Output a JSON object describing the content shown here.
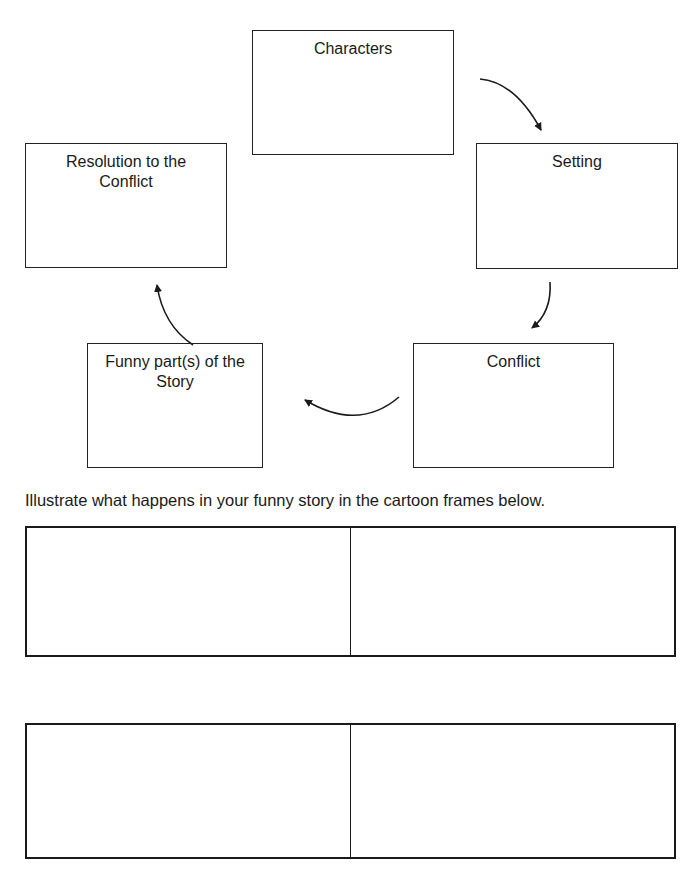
{
  "story_map": {
    "boxes": [
      {
        "id": "characters",
        "label": "Characters"
      },
      {
        "id": "setting",
        "label": "Setting"
      },
      {
        "id": "conflict",
        "label": "Conflict"
      },
      {
        "id": "funny_parts",
        "label": "Funny part(s) of the\nStory"
      },
      {
        "id": "resolution",
        "label": "Resolution to the\nConflict"
      }
    ],
    "flow": [
      "Characters",
      "Setting",
      "Conflict",
      "Funny part(s) of the Story",
      "Resolution to the Conflict"
    ]
  },
  "instructions": "Illustrate what happens in your funny story in the cartoon frames below.",
  "cartoon_frames": {
    "rows": 2,
    "frames_per_row": 2
  },
  "colors": {
    "line": "#1a1a1a",
    "background": "#ffffff"
  }
}
